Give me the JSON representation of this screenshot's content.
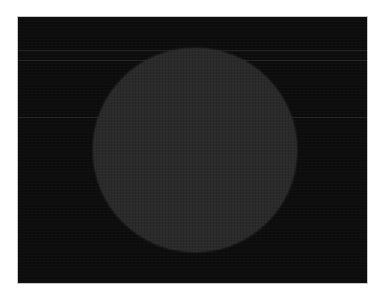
{
  "image": {
    "width": 381,
    "height": 297,
    "background_color": "#ffffff",
    "frame": {
      "left": 18,
      "top": 17,
      "width": 349,
      "height": 266,
      "color": "#0d0d0d"
    },
    "disk": {
      "center_x": 195,
      "center_y": 150,
      "diameter": 204,
      "color": "#2a2a2a"
    },
    "scanlines_y": [
      33,
      43,
      100
    ]
  }
}
